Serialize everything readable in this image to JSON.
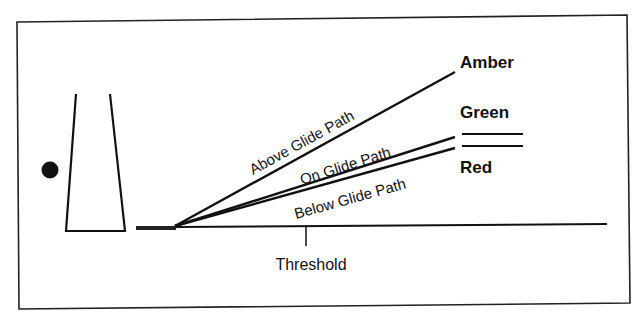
{
  "diagram": {
    "title": "",
    "labels": {
      "above": "Above Glide Path",
      "on": "On Glide Path",
      "below": "Below Glide Path",
      "threshold": "Threshold"
    },
    "indicators": [
      {
        "name": "amber",
        "label": "Amber"
      },
      {
        "name": "green",
        "label": "Green"
      },
      {
        "name": "red",
        "label": "Red"
      }
    ],
    "colors": {
      "stroke": "#111111",
      "background": "#ffffff"
    }
  }
}
